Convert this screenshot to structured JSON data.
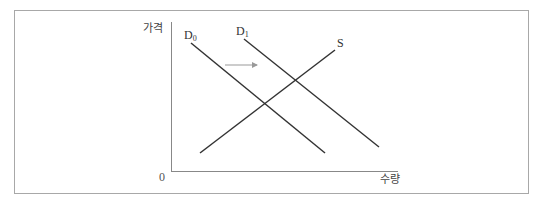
{
  "diagram": {
    "title": "",
    "axes": {
      "y_label": "가격",
      "x_label": "수량",
      "origin_label": "0"
    },
    "curves": [
      {
        "id": "D0",
        "label_main": "D",
        "label_sub": "0",
        "type": "demand",
        "color": "#333333"
      },
      {
        "id": "D1",
        "label_main": "D",
        "label_sub": "1",
        "type": "demand",
        "color": "#333333"
      },
      {
        "id": "S",
        "label_main": "S",
        "label_sub": "",
        "type": "supply",
        "color": "#333333"
      }
    ],
    "shift_arrow": {
      "from": "D0",
      "to": "D1",
      "direction": "right",
      "color": "#999999"
    },
    "colors": {
      "frame": "#a8a8a8",
      "axis": "#888888",
      "line": "#333333",
      "arrow": "#999999"
    }
  }
}
